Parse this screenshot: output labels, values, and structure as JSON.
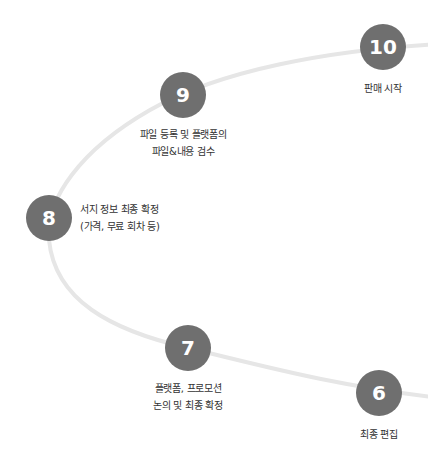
{
  "diagram": {
    "type": "process-arc",
    "colors": {
      "circle": "#6f6f6f",
      "curve": "#e6e6e6",
      "number": "#ffffff",
      "text": "#333333"
    },
    "steps": [
      {
        "number": "10",
        "label_lines": [
          "판매 시작"
        ]
      },
      {
        "number": "9",
        "label_lines": [
          "파일 등록 및 플랫폼의",
          "파일&내용 검수"
        ]
      },
      {
        "number": "8",
        "label_lines": [
          "서지 정보 최종 확정",
          "(가격, 무료 회차 등)"
        ]
      },
      {
        "number": "7",
        "label_lines": [
          "플랫폼, 프로모션",
          "논의 및 최종 확정"
        ]
      },
      {
        "number": "6",
        "label_lines": [
          "최종 편집"
        ]
      }
    ]
  }
}
